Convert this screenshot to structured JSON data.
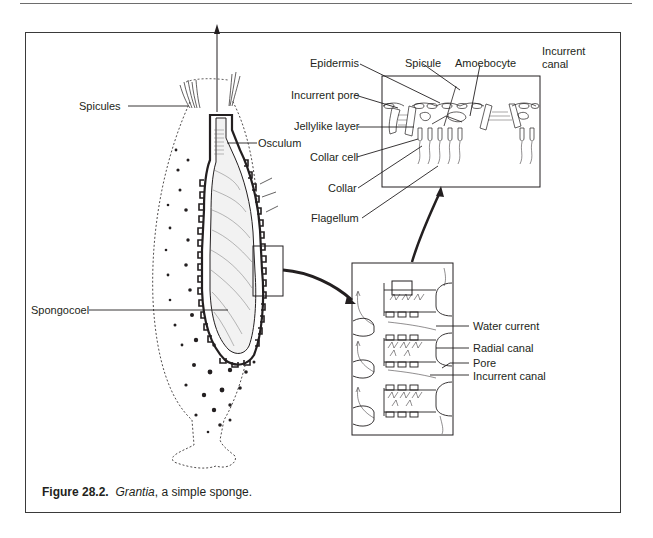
{
  "figure": {
    "number_label": "Figure 28.2.",
    "genus": "Grantia",
    "caption_rest": ", a simple sponge."
  },
  "labels": {
    "whole_sponge": {
      "spicules": "Spicules",
      "osculum": "Osculum",
      "spongocoel": "Spongocoel"
    },
    "cell_detail": {
      "epidermis": "Epidermis",
      "spicule": "Spicule",
      "amoebocyte": "Amoebocyte",
      "incurrent_canal_line1": "Incurrent",
      "incurrent_canal_line2": "canal",
      "incurrent_pore": "Incurrent pore",
      "jellylike_layer": "Jellylike layer",
      "collar_cell": "Collar cell",
      "collar": "Collar",
      "flagellum": "Flagellum"
    },
    "canal_section": {
      "water_current": "Water current",
      "radial_canal": "Radial canal",
      "pore": "Pore",
      "incurrent_canal": "Incurrent canal"
    }
  },
  "colors": {
    "ink": "#231f20",
    "frame": "#3a3a3a",
    "background": "#ffffff"
  }
}
